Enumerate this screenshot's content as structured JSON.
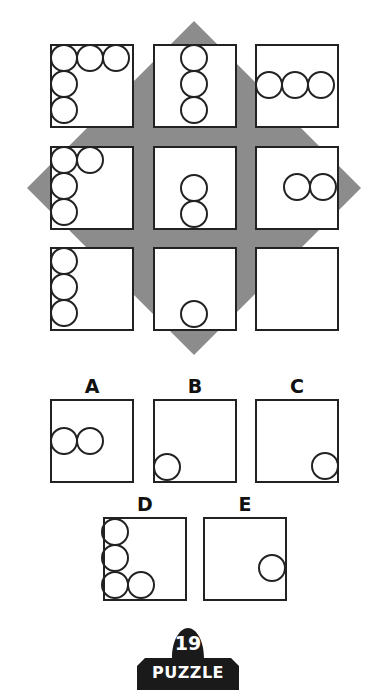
{
  "puzzle": {
    "number": "19",
    "title": "PUZZLE",
    "colors": {
      "diamond": "#8c8c8c",
      "stroke": "#222222",
      "box_fill": "#ffffff",
      "badge": "#1a1a1a"
    },
    "diamond": {
      "top": [
        194,
        21
      ],
      "right": [
        361,
        188
      ],
      "bottom": [
        194,
        355
      ],
      "left": [
        27,
        188
      ]
    },
    "circle_diameter": 26,
    "grid": [
      {
        "name": "cell-1-1",
        "x": 51,
        "y": 45,
        "circles": [
          [
            13,
            13
          ],
          [
            39,
            13
          ],
          [
            65,
            13
          ],
          [
            13,
            39
          ],
          [
            13,
            65
          ]
        ]
      },
      {
        "name": "cell-1-2",
        "x": 154,
        "y": 45,
        "circles": [
          [
            40,
            13
          ],
          [
            40,
            39
          ],
          [
            40,
            65
          ]
        ]
      },
      {
        "name": "cell-1-3",
        "x": 256,
        "y": 45,
        "circles": [
          [
            13,
            40
          ],
          [
            39,
            40
          ],
          [
            65,
            40
          ]
        ]
      },
      {
        "name": "cell-2-1",
        "x": 51,
        "y": 147,
        "circles": [
          [
            13,
            13
          ],
          [
            39,
            13
          ],
          [
            13,
            39
          ],
          [
            13,
            65
          ]
        ]
      },
      {
        "name": "cell-2-2",
        "x": 154,
        "y": 147,
        "circles": [
          [
            40,
            41
          ],
          [
            40,
            67
          ]
        ]
      },
      {
        "name": "cell-2-3",
        "x": 256,
        "y": 147,
        "circles": [
          [
            41,
            40
          ],
          [
            67,
            40
          ]
        ]
      },
      {
        "name": "cell-3-1",
        "x": 51,
        "y": 248,
        "circles": [
          [
            13,
            13
          ],
          [
            13,
            39
          ],
          [
            13,
            65
          ]
        ]
      },
      {
        "name": "cell-3-2",
        "x": 154,
        "y": 248,
        "circles": [
          [
            40,
            66
          ]
        ]
      },
      {
        "name": "cell-3-3",
        "x": 256,
        "y": 248,
        "circles": []
      }
    ],
    "box_size": 82,
    "options": [
      {
        "label": "A",
        "x": 51,
        "y": 400,
        "circles": [
          [
            13,
            41
          ],
          [
            39,
            41
          ]
        ]
      },
      {
        "label": "B",
        "x": 154,
        "y": 400,
        "circles": [
          [
            13,
            67
          ]
        ]
      },
      {
        "label": "C",
        "x": 256,
        "y": 400,
        "circles": [
          [
            69,
            66
          ]
        ]
      },
      {
        "label": "D",
        "x": 104,
        "y": 518,
        "circles": [
          [
            11,
            14
          ],
          [
            11,
            40
          ],
          [
            11,
            67
          ],
          [
            37,
            67
          ]
        ]
      },
      {
        "label": "E",
        "x": 204,
        "y": 518,
        "circles": [
          [
            68,
            50
          ]
        ]
      }
    ]
  }
}
